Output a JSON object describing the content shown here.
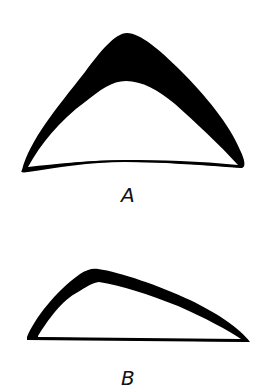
{
  "figures": [
    {
      "id": "A",
      "label": "A",
      "description": "Symmetric arched shape with thick dark crown tapering to thin base line"
    },
    {
      "id": "B",
      "label": "B",
      "description": "Asymmetric low arched shape with apex shifted left, thin dark band and straight base"
    }
  ],
  "colors": {
    "ink": "#000000",
    "background": "#ffffff"
  }
}
